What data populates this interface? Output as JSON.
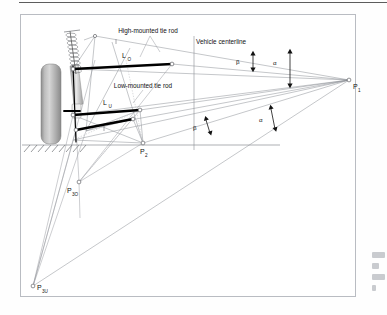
{
  "figure": {
    "domain": "technical-engineering-diagram",
    "background_color": "#ffffff",
    "frame_color": "#b9bcc2",
    "line_color": "#8b8e94",
    "bold_line_color": "#000000",
    "tire_color": "#9a9a9a"
  },
  "annotations": {
    "high_tie_rod": "High-mounted tie rod",
    "low_tie_rod": "Low-mounted tie rod",
    "vehicle_centerline": "Vehicle centerline"
  },
  "length_labels": {
    "upper_rod": "L",
    "upper_rod_sub": "O",
    "lower_rod": "L",
    "lower_rod_sub": "U"
  },
  "points": [
    {
      "id": "P1",
      "base": "P",
      "sub": "1",
      "x": 349,
      "y": 80,
      "label_dx": 4,
      "label_dy": 9
    },
    {
      "id": "P2",
      "base": "P",
      "sub": "2",
      "x": 143,
      "y": 143,
      "label_dx": -3,
      "label_dy": 11
    },
    {
      "id": "P3O",
      "base": "P",
      "sub": "3O",
      "x": 79,
      "y": 182,
      "label_dx": -12,
      "label_dy": 11
    },
    {
      "id": "P3U",
      "base": "P",
      "sub": "3U",
      "x": 33,
      "y": 286,
      "label_dx": 4,
      "label_dy": 4
    }
  ],
  "angles": [
    {
      "id": "beta-upper",
      "glyph": "β",
      "x": 239,
      "y": 61,
      "arrow_x": 253,
      "arrow_y0": 53,
      "arrow_y1": 70,
      "style": "vertical"
    },
    {
      "id": "alpha-upper",
      "glyph": "α",
      "x": 277,
      "y": 62,
      "arrow_x": 290,
      "arrow_y0": 50,
      "arrow_y1": 87,
      "style": "vertical"
    },
    {
      "id": "beta-lower",
      "glyph": "β",
      "x": 196,
      "y": 127,
      "arrow_x": 208,
      "arrow_y0": 119,
      "arrow_y1": 134,
      "style": "slanted"
    },
    {
      "id": "alpha-lower",
      "glyph": "α",
      "x": 262,
      "y": 119,
      "arrow_x": 272,
      "arrow_y0": 107,
      "arrow_y1": 130,
      "style": "slanted"
    }
  ],
  "ground": {
    "line_y": 145,
    "x_start": 22,
    "x_end": 280,
    "hatch_start": 24,
    "hatch_end": 86
  },
  "centerline": {
    "x": 194,
    "y_top": 36,
    "y_bottom": 150
  },
  "tire": {
    "x": 41,
    "y": 64,
    "width": 20,
    "height": 80
  },
  "tie_rods": {
    "upper": {
      "x1": 73,
      "y1": 69,
      "x2": 172,
      "y2": 64
    },
    "lower": {
      "x1": 73,
      "y1": 115,
      "x2": 140,
      "y2": 110
    },
    "lower_track": {
      "x1": 76,
      "y1": 130,
      "x2": 133,
      "y2": 119
    }
  },
  "margin_note": {
    "present": true,
    "description": "clipped page text at right margin"
  }
}
